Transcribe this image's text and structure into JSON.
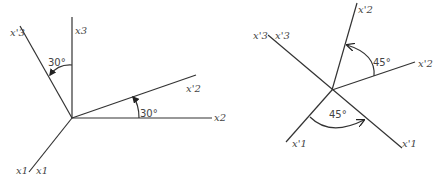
{
  "figure": {
    "left_panel": {
      "axes": {
        "x3": "x3",
        "x3_prime": "x'3",
        "x2": "x2",
        "x2_prime": "x'2",
        "x1_left": "x1",
        "x1_right": "x1"
      },
      "angles": {
        "top": "30°",
        "right": "30°"
      }
    },
    "right_panel": {
      "axes": {
        "x3_prime_a": "x'3",
        "x3_prime_b": "x'3",
        "x2_prime_top": "x'2",
        "x2_prime_right": "x'2",
        "x1_prime_left": "x'1",
        "x1_prime_right": "x'1"
      },
      "angles": {
        "top": "45°",
        "bottom": "45°"
      }
    }
  }
}
